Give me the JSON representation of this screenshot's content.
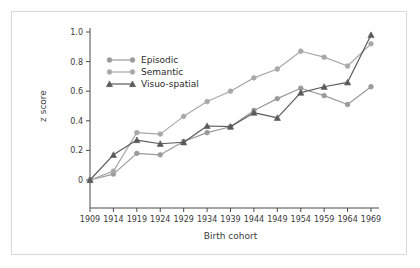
{
  "figure": {
    "background_color": "#ffffff",
    "frame_color": "#d8d8d8"
  },
  "axes": {
    "y_label": "z score",
    "x_label": "Birth cohort",
    "y_ticks": [
      "0",
      "0.2",
      "0.4",
      "0.6",
      "0.8",
      "1.0"
    ],
    "x_ticks": [
      "1909",
      "1914",
      "1919",
      "1924",
      "1929",
      "1934",
      "1939",
      "1944",
      "1949",
      "1954",
      "1959",
      "1964",
      "1969"
    ],
    "axis_color": "#4a4a4a"
  },
  "legend": {
    "items": [
      {
        "label": "Episodic",
        "color": "#9a9a9a",
        "marker": "circle"
      },
      {
        "label": "Semantic",
        "color": "#a8a8a8",
        "marker": "circle"
      },
      {
        "label": "Visuo-spatial",
        "color": "#5a5a5a",
        "marker": "triangle"
      }
    ]
  },
  "chart_data": {
    "type": "line",
    "title": "",
    "xlabel": "Birth cohort",
    "ylabel": "z score",
    "x": [
      1909,
      1914,
      1919,
      1924,
      1929,
      1934,
      1939,
      1944,
      1949,
      1954,
      1959,
      1964,
      1969
    ],
    "categories": [
      "1909",
      "1914",
      "1919",
      "1924",
      "1929",
      "1934",
      "1939",
      "1944",
      "1949",
      "1954",
      "1959",
      "1964",
      "1969"
    ],
    "xlim": [
      1909,
      1969
    ],
    "ylim": [
      0,
      1.0
    ],
    "ytick_values": [
      0,
      0.2,
      0.4,
      0.6,
      0.8,
      1.0
    ],
    "grid": false,
    "legend_position": "upper-left-inside",
    "series": [
      {
        "name": "Episodic",
        "color": "#9a9a9a",
        "marker": "circle",
        "values": [
          0.0,
          0.04,
          0.18,
          0.17,
          0.26,
          0.32,
          0.36,
          0.47,
          0.55,
          0.62,
          0.57,
          0.51,
          0.63
        ]
      },
      {
        "name": "Semantic",
        "color": "#a8a8a8",
        "marker": "circle",
        "values": [
          0.0,
          0.06,
          0.32,
          0.31,
          0.43,
          0.53,
          0.6,
          0.69,
          0.75,
          0.87,
          0.83,
          0.77,
          0.92
        ]
      },
      {
        "name": "Visuo-spatial",
        "color": "#5a5a5a",
        "marker": "triangle",
        "values": [
          0.0,
          0.17,
          0.27,
          0.245,
          0.255,
          0.365,
          0.36,
          0.455,
          0.42,
          0.59,
          0.63,
          0.66,
          0.98
        ]
      }
    ]
  }
}
